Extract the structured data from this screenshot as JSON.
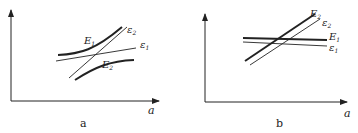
{
  "panels": [
    {
      "id": "a",
      "caption": "a",
      "x_axis_label": "a",
      "curves": [
        {
          "name": "E1",
          "label": "E",
          "sub": "1",
          "style": "thick",
          "kind": "upper-hyperbola"
        },
        {
          "name": "E2",
          "label": "E",
          "sub": "2",
          "style": "thick",
          "kind": "lower-hyperbola"
        },
        {
          "name": "eps1",
          "label": "ε",
          "sub": "1",
          "style": "thin",
          "kind": "line"
        },
        {
          "name": "eps2",
          "label": "ε",
          "sub": "2",
          "style": "thin",
          "kind": "line"
        }
      ]
    },
    {
      "id": "b",
      "caption": "b",
      "x_axis_label": "a",
      "curves": [
        {
          "name": "E2",
          "label": "E",
          "sub": "2",
          "style": "thick",
          "kind": "line"
        },
        {
          "name": "eps2",
          "label": "ε",
          "sub": "2",
          "style": "thin",
          "kind": "line"
        },
        {
          "name": "E1",
          "label": "E",
          "sub": "1",
          "style": "thick",
          "kind": "line"
        },
        {
          "name": "eps1",
          "label": "ε",
          "sub": "1",
          "style": "thin",
          "kind": "line"
        }
      ]
    }
  ],
  "colors": {
    "ink": "#222222",
    "background": "#ffffff"
  }
}
